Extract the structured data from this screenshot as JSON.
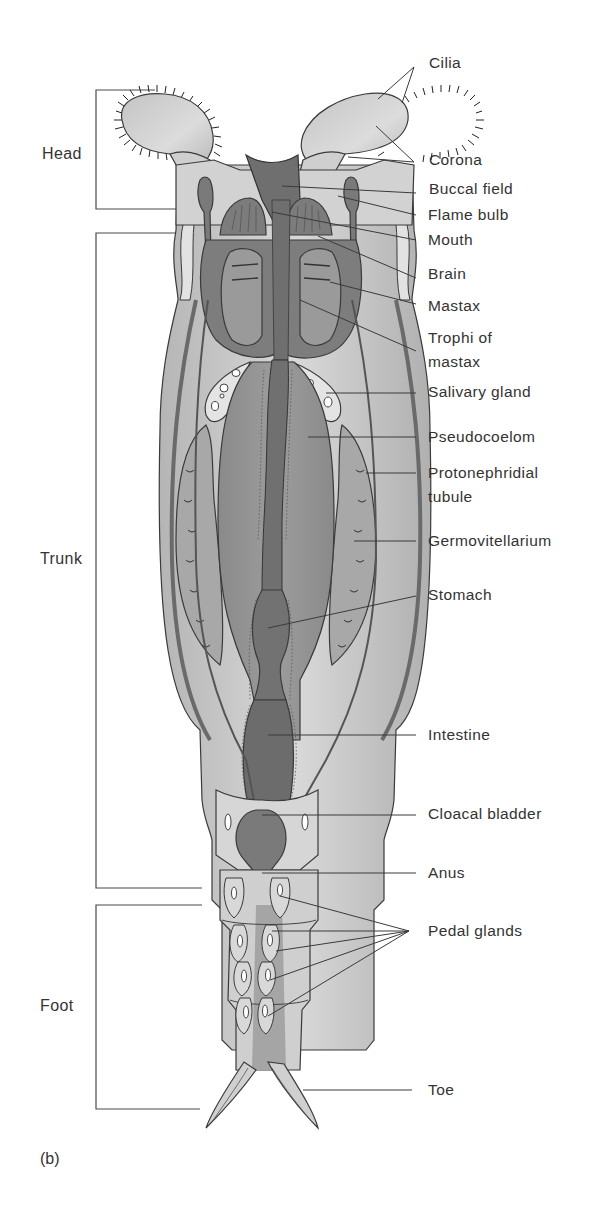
{
  "figure": {
    "panel_label": "(b)",
    "regions": [
      {
        "name": "Head",
        "y_top": 90,
        "y_bottom": 209
      },
      {
        "name": "Trunk",
        "y_top": 233,
        "y_bottom": 888
      },
      {
        "name": "Foot",
        "y_top": 905,
        "y_bottom": 1109
      }
    ],
    "labels": [
      {
        "id": "cilia",
        "text": "Cilia",
        "y": 63
      },
      {
        "id": "corona",
        "text": "Corona",
        "y": 160
      },
      {
        "id": "buccal-field",
        "text": "Buccal field",
        "y": 189
      },
      {
        "id": "flame-bulb",
        "text": "Flame bulb",
        "y": 215
      },
      {
        "id": "mouth",
        "text": "Mouth",
        "y": 240
      },
      {
        "id": "brain",
        "text": "Brain",
        "y": 273
      },
      {
        "id": "mastax",
        "text": "Mastax",
        "y": 300
      },
      {
        "id": "trophi",
        "text": "Trophi of",
        "text2": "mastax",
        "y": 333
      },
      {
        "id": "salivary-gland",
        "text": "Salivary gland",
        "y": 392
      },
      {
        "id": "pseudocoelom",
        "text": "Pseudocoelom",
        "y": 437
      },
      {
        "id": "protonephridial",
        "text": "Protonephridial",
        "text2": "tubule",
        "y": 473
      },
      {
        "id": "germovitellarium",
        "text": "Germovitellarium",
        "y": 541
      },
      {
        "id": "stomach",
        "text": "Stomach",
        "y": 595
      },
      {
        "id": "intestine",
        "text": "Intestine",
        "y": 735
      },
      {
        "id": "cloacal-bladder",
        "text": "Cloacal bladder",
        "y": 815
      },
      {
        "id": "anus",
        "text": "Anus",
        "y": 873
      },
      {
        "id": "pedal-glands",
        "text": "Pedal glands",
        "y": 932
      },
      {
        "id": "toe",
        "text": "Toe",
        "y": 1090
      }
    ],
    "colors": {
      "dark_tissue": "#7a7a7a",
      "mid_tissue": "#9a9a9a",
      "light_tissue": "#c8c8c8",
      "pale_tissue": "#dedede",
      "outline": "#3a3a3a",
      "leader_line": "#3a3a3a",
      "text": "#333333"
    }
  }
}
